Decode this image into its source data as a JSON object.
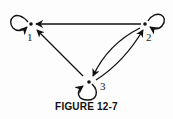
{
  "figure": {
    "caption": "FIGURE 12-7",
    "colors": {
      "ink": "#111111",
      "background": "#fdfdfd"
    }
  },
  "graph": {
    "nodes": [
      {
        "id": "1",
        "label": "1",
        "x": 31,
        "y": 24
      },
      {
        "id": "2",
        "label": "2",
        "x": 145,
        "y": 24
      },
      {
        "id": "3",
        "label": "3",
        "x": 89,
        "y": 82
      }
    ],
    "edges": [
      {
        "from": "1",
        "to": "1",
        "type": "self-loop"
      },
      {
        "from": "2",
        "to": "2",
        "type": "self-loop"
      },
      {
        "from": "3",
        "to": "3",
        "type": "self-loop"
      },
      {
        "from": "2",
        "to": "1",
        "type": "directed"
      },
      {
        "from": "3",
        "to": "1",
        "type": "directed"
      },
      {
        "from": "2",
        "to": "3",
        "type": "directed"
      },
      {
        "from": "3",
        "to": "2",
        "type": "directed"
      }
    ]
  }
}
